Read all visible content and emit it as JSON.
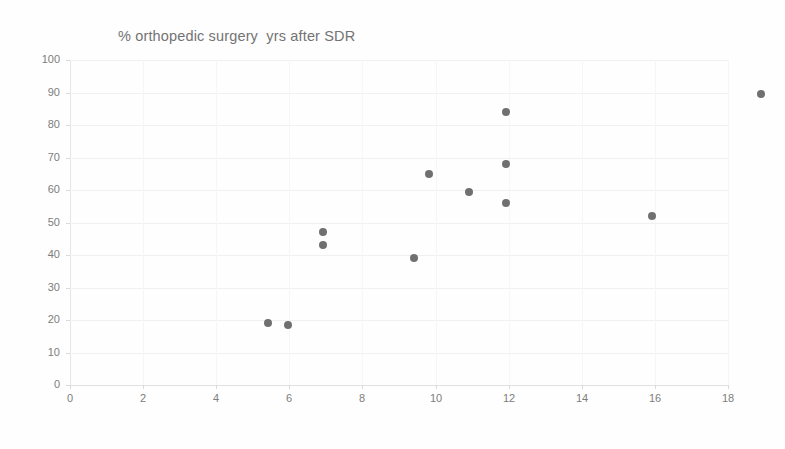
{
  "chart_data": {
    "type": "scatter",
    "title": "% orthopedic surgery  yrs after SDR",
    "xlabel": "",
    "ylabel": "",
    "xlim": [
      0,
      18
    ],
    "ylim": [
      0,
      100
    ],
    "xticks": [
      0,
      2,
      4,
      6,
      8,
      10,
      12,
      14,
      16,
      18
    ],
    "yticks": [
      0,
      10,
      20,
      30,
      40,
      50,
      60,
      70,
      80,
      90,
      100
    ],
    "grid": "horizontal",
    "legend": "none",
    "marker_color": "#5c5c5c",
    "gridline_color": "#eef0f2",
    "axis_color": "#d8dadd",
    "text_color": "#7d7d7d",
    "series": [
      {
        "name": "% orthopedic surgery",
        "points": [
          {
            "x": 3.5,
            "y": 19.0
          },
          {
            "x": 4.05,
            "y": 18.5
          },
          {
            "x": 5.0,
            "y": 47.0
          },
          {
            "x": 5.0,
            "y": 43.0
          },
          {
            "x": 7.5,
            "y": 39.0
          },
          {
            "x": 7.9,
            "y": 65.0
          },
          {
            "x": 9.0,
            "y": 59.5
          },
          {
            "x": 10.0,
            "y": 84.0
          },
          {
            "x": 10.0,
            "y": 68.0
          },
          {
            "x": 10.0,
            "y": 56.0
          },
          {
            "x": 14.0,
            "y": 52.0
          },
          {
            "x": 17.0,
            "y": 89.5
          }
        ]
      }
    ]
  }
}
